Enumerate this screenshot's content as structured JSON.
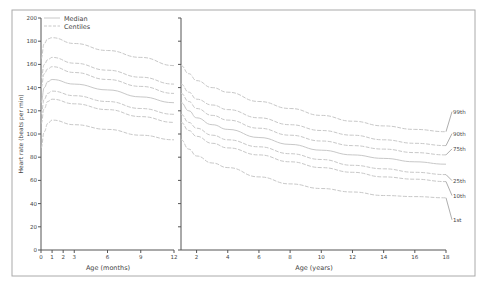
{
  "chart_data": {
    "type": "line",
    "title": "",
    "ylabel": "Heart rate (beats per min)",
    "ylim": [
      0,
      200
    ],
    "yticks": [
      0,
      20,
      40,
      60,
      80,
      100,
      120,
      140,
      160,
      180,
      200
    ],
    "legend": [
      {
        "label": "Median",
        "style": "solid"
      },
      {
        "label": "Centiles",
        "style": "dashed"
      }
    ],
    "panels": [
      {
        "name": "infants",
        "xlabel": "Age (months)",
        "xlim": [
          0,
          12
        ],
        "xticks": [
          0,
          1,
          2,
          3,
          6,
          9,
          12
        ],
        "x": [
          0,
          0.3,
          0.6,
          1,
          3,
          6,
          9,
          12
        ],
        "series": [
          {
            "name": "99th",
            "values": [
              165,
              178,
              182,
              183,
              178,
              172,
              166,
              159
            ]
          },
          {
            "name": "90th",
            "values": [
              148,
              160,
              164,
              166,
              161,
              155,
              149,
              143
            ]
          },
          {
            "name": "75th",
            "values": [
              140,
              152,
              156,
              158,
              153,
              147,
              141,
              135
            ]
          },
          {
            "name": "50th",
            "values": [
              127,
              140,
              145,
              147,
              143,
              138,
              132,
              127
            ]
          },
          {
            "name": "25th",
            "values": [
              117,
              130,
              135,
              137,
              133,
              128,
              122,
              117
            ]
          },
          {
            "name": "10th",
            "values": [
              109,
              122,
              128,
              130,
              126,
              121,
              115,
              110
            ]
          },
          {
            "name": "1st",
            "values": [
              88,
              102,
              109,
              112,
              108,
              104,
              99,
              95
            ]
          }
        ]
      },
      {
        "name": "children",
        "xlabel": "Age (years)",
        "xlim": [
          1,
          18
        ],
        "xticks": [
          2,
          4,
          6,
          8,
          10,
          12,
          14,
          16,
          18
        ],
        "x": [
          1,
          1.5,
          2,
          3,
          4,
          6,
          8,
          10,
          12,
          14,
          16,
          18
        ],
        "series": [
          {
            "name": "99th",
            "values": [
              159,
              152,
              146,
              140,
              136,
              128,
              122,
              116,
              111,
              107,
              104,
              102
            ]
          },
          {
            "name": "90th",
            "values": [
              143,
              136,
              130,
              125,
              121,
              114,
              108,
              103,
              99,
              95,
              92,
              90
            ]
          },
          {
            "name": "75th",
            "values": [
              135,
              128,
              122,
              116,
              112,
              105,
              99,
              94,
              90,
              87,
              84,
              82
            ]
          },
          {
            "name": "50th",
            "values": [
              127,
              120,
              114,
              108,
              104,
              97,
              91,
              86,
              82,
              79,
              76,
              74
            ]
          },
          {
            "name": "25th",
            "values": [
              117,
              110,
              105,
              99,
              95,
              89,
              83,
              78,
              73,
              70,
              67,
              65
            ]
          },
          {
            "name": "10th",
            "values": [
              110,
              103,
              98,
              92,
              88,
              82,
              76,
              71,
              67,
              63,
              61,
              59
            ]
          },
          {
            "name": "1st",
            "values": [
              95,
              87,
              81,
              75,
              71,
              63,
              57,
              53,
              50,
              47,
              46,
              45
            ]
          }
        ]
      }
    ],
    "centile_labels": [
      "99th",
      "90th",
      "75th",
      "25th",
      "10th",
      "1st"
    ],
    "line_color": "#c8c8c8",
    "axis_color": "#555555",
    "frame_color": "#aaaaaa"
  }
}
